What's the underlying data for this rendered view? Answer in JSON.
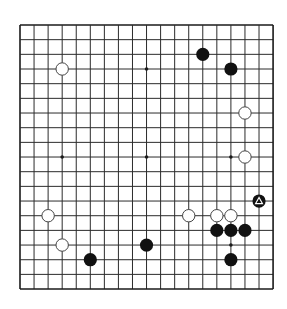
{
  "board": {
    "size": 19,
    "origin_x": 20,
    "origin_y": 25,
    "spacing_x": 14.06,
    "spacing_y": 14.67,
    "line_color": "#2b2b2b",
    "border_color": "#1a1a1a",
    "background": "#ffffff",
    "star_points": [
      [
        3,
        3
      ],
      [
        9,
        3
      ],
      [
        15,
        3
      ],
      [
        3,
        9
      ],
      [
        9,
        9
      ],
      [
        15,
        9
      ],
      [
        3,
        15
      ],
      [
        9,
        15
      ],
      [
        15,
        15
      ]
    ]
  },
  "stones": [
    {
      "color": "white",
      "col": 3,
      "row": 3
    },
    {
      "color": "black",
      "col": 13,
      "row": 2
    },
    {
      "color": "black",
      "col": 15,
      "row": 3
    },
    {
      "color": "white",
      "col": 16,
      "row": 6
    },
    {
      "color": "white",
      "col": 16,
      "row": 9
    },
    {
      "color": "black",
      "col": 17,
      "row": 12,
      "marker": "triangle"
    },
    {
      "color": "white",
      "col": 2,
      "row": 13
    },
    {
      "color": "white",
      "col": 12,
      "row": 13
    },
    {
      "color": "white",
      "col": 14,
      "row": 13
    },
    {
      "color": "white",
      "col": 15,
      "row": 13
    },
    {
      "color": "black",
      "col": 14,
      "row": 14
    },
    {
      "color": "black",
      "col": 15,
      "row": 14
    },
    {
      "color": "black",
      "col": 16,
      "row": 14
    },
    {
      "color": "white",
      "col": 3,
      "row": 15
    },
    {
      "color": "black",
      "col": 9,
      "row": 15
    },
    {
      "color": "black",
      "col": 5,
      "row": 16
    },
    {
      "color": "black",
      "col": 15,
      "row": 16
    }
  ],
  "colors": {
    "black_stone": "#111111",
    "white_stone_fill": "#ffffff",
    "white_stone_stroke": "#444444",
    "marker": "#ffffff"
  }
}
